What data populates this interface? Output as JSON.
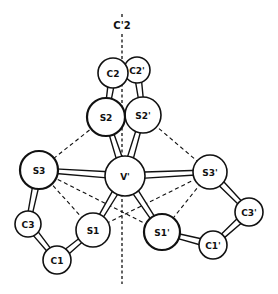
{
  "figure": {
    "axis_label": "C'2",
    "atoms": [
      {
        "id": "V",
        "label": "V'",
        "x": 125,
        "y": 176,
        "r": 20
      },
      {
        "id": "C2",
        "label": "C2",
        "x": 113,
        "y": 73,
        "r": 15
      },
      {
        "id": "C2p",
        "label": "C2'",
        "x": 137,
        "y": 70,
        "r": 13
      },
      {
        "id": "S2",
        "label": "S2",
        "x": 106,
        "y": 117,
        "r": 19
      },
      {
        "id": "S2p",
        "label": "S2'",
        "x": 143,
        "y": 115,
        "r": 18
      },
      {
        "id": "S3",
        "label": "S3",
        "x": 39,
        "y": 170,
        "r": 19
      },
      {
        "id": "S3p",
        "label": "S3'",
        "x": 210,
        "y": 172,
        "r": 17
      },
      {
        "id": "C3",
        "label": "C3",
        "x": 28,
        "y": 224,
        "r": 13
      },
      {
        "id": "C1",
        "label": "C1",
        "x": 57,
        "y": 260,
        "r": 14
      },
      {
        "id": "S1",
        "label": "S1",
        "x": 93,
        "y": 230,
        "r": 17
      },
      {
        "id": "S1p",
        "label": "S1'",
        "x": 162,
        "y": 232,
        "r": 18
      },
      {
        "id": "C1p",
        "label": "C1'",
        "x": 213,
        "y": 245,
        "r": 14
      },
      {
        "id": "C3p",
        "label": "C3'",
        "x": 249,
        "y": 212,
        "r": 14
      }
    ],
    "bonds": [
      [
        "V",
        "S3"
      ],
      [
        "V",
        "S3p"
      ],
      [
        "V",
        "S2"
      ],
      [
        "V",
        "S2p"
      ],
      [
        "V",
        "S1"
      ],
      [
        "V",
        "S1p"
      ],
      [
        "C2",
        "S2"
      ],
      [
        "C2p",
        "S2p"
      ],
      [
        "C2",
        "C2p"
      ],
      [
        "S3",
        "C3"
      ],
      [
        "C3",
        "C1"
      ],
      [
        "C1",
        "S1"
      ],
      [
        "S3p",
        "C3p"
      ],
      [
        "C3p",
        "C1p"
      ],
      [
        "C1p",
        "S1p"
      ]
    ],
    "dashed_edges": [
      [
        "S2",
        "S3"
      ],
      [
        "S2p",
        "S3p"
      ],
      [
        "S3",
        "S1p"
      ],
      [
        "S3p",
        "S1"
      ],
      [
        "S3",
        "S1"
      ],
      [
        "S3p",
        "S1p"
      ],
      [
        "S2",
        "V"
      ],
      [
        "S2p",
        "V"
      ],
      [
        "S1",
        "V"
      ],
      [
        "S1p",
        "V"
      ]
    ]
  }
}
